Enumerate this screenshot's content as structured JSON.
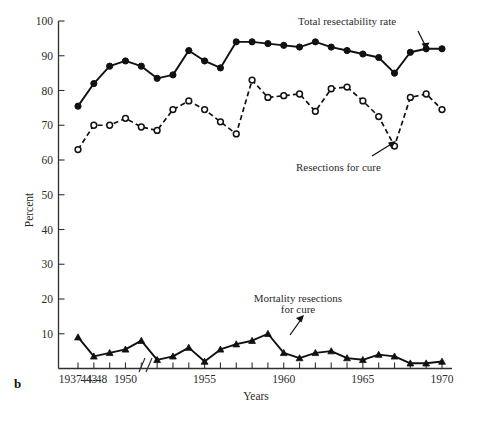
{
  "figure": {
    "panel_letter": "b"
  },
  "chart_data": {
    "type": "line",
    "title": "",
    "xlabel": "Years",
    "ylabel": "Percent",
    "ylim": [
      0,
      100
    ],
    "ytick_values": [
      10,
      20,
      30,
      40,
      50,
      60,
      70,
      80,
      90,
      100
    ],
    "ytick_labels": [
      "10",
      "20",
      "30",
      "40",
      "50",
      "60",
      "70",
      "80",
      "90",
      "100"
    ],
    "grid": false,
    "legend_position": "inline-annotations",
    "axis_break": {
      "present": true,
      "between": [
        "44-48",
        "1949"
      ],
      "symbol": "//"
    },
    "x": [
      "1937-43",
      "44-48",
      "1949",
      "1950",
      "1951",
      "1952",
      "1953",
      "1954",
      "1955",
      "1956",
      "1957",
      "1958",
      "1959",
      "1960",
      "1961",
      "1962",
      "1963",
      "1964",
      "1965",
      "1966",
      "1967",
      "1968",
      "1969",
      "1970"
    ],
    "xtick_labels": [
      "1937-43",
      "44-48",
      "",
      "1950",
      "",
      "",
      "",
      "",
      "1955",
      "",
      "",
      "",
      "",
      "1960",
      "",
      "",
      "",
      "",
      "1965",
      "",
      "",
      "",
      "",
      "1970"
    ],
    "series": [
      {
        "name": "Total resectability rate",
        "marker": "filled-circle",
        "line_style": "solid",
        "values": [
          75.5,
          82,
          87,
          88.5,
          87,
          83.5,
          84.5,
          91.5,
          88.5,
          86.5,
          94,
          94,
          93.5,
          93,
          92.5,
          94,
          92.5,
          91.5,
          90.5,
          89.5,
          85,
          91,
          92,
          92
        ]
      },
      {
        "name": "Resections for cure",
        "marker": "open-circle",
        "line_style": "dashed",
        "values": [
          63,
          70,
          70,
          72,
          69.5,
          68.5,
          74.5,
          77,
          74.5,
          71,
          67.5,
          83,
          78,
          78.5,
          79,
          74,
          80.5,
          81,
          77,
          72.5,
          64,
          78,
          79,
          74.5
        ]
      },
      {
        "name": "Mortality resections for cure",
        "marker": "filled-triangle",
        "line_style": "solid",
        "values": [
          9,
          3.5,
          4.5,
          5.5,
          8,
          2.5,
          3.5,
          6,
          2,
          5.5,
          7,
          8,
          10,
          4.5,
          3,
          4.5,
          5,
          3,
          2.5,
          4,
          3.5,
          1.5,
          1.5,
          2
        ]
      }
    ],
    "annotations": [
      {
        "text": "Total resectability rate",
        "anchor": "series-1"
      },
      {
        "text": "Resections for cure",
        "anchor": "series-2"
      },
      {
        "text": "Mortality resections",
        "anchor": "series-3"
      },
      {
        "text": "for cure",
        "anchor": "series-3"
      }
    ]
  }
}
